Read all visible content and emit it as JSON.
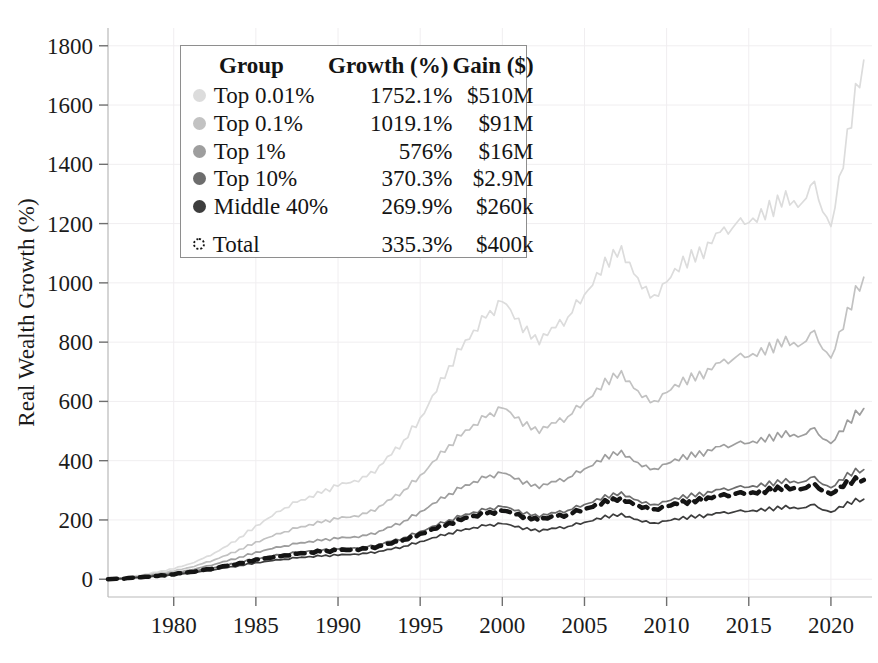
{
  "chart_data": {
    "type": "line",
    "title": "",
    "xlabel": "",
    "ylabel": "Real Wealth Growth (%)",
    "xlim": [
      1976,
      2022.5
    ],
    "ylim": [
      -60,
      1860
    ],
    "grid": true,
    "legend_position": "upper-left-inset",
    "xticks": [
      1980,
      1985,
      1990,
      1995,
      2000,
      2005,
      2010,
      2015,
      2020
    ],
    "yticks": [
      0,
      200,
      400,
      600,
      800,
      1000,
      1200,
      1400,
      1600,
      1800
    ],
    "x": [
      1976,
      1977,
      1978,
      1979,
      1980,
      1981,
      1982,
      1983,
      1984,
      1985,
      1986,
      1987,
      1988,
      1989,
      1990,
      1991,
      1992,
      1993,
      1994,
      1995,
      1996,
      1997,
      1998,
      1999,
      2000,
      2001,
      2002,
      2003,
      2004,
      2005,
      2006,
      2007,
      2008,
      2009,
      2010,
      2011,
      2012,
      2013,
      2014,
      2015,
      2016,
      2017,
      2018,
      2019,
      2020,
      2021,
      2022
    ],
    "series": [
      {
        "name": "Top 0.01%",
        "color": "#dcdcdc",
        "style": "solid",
        "growth_pct": "1752.1%",
        "gain_usd": "$510M",
        "values": [
          0,
          6,
          14,
          24,
          36,
          52,
          74,
          104,
          140,
          178,
          215,
          250,
          272,
          292,
          318,
          330,
          352,
          408,
          468,
          540,
          640,
          742,
          820,
          880,
          940,
          870,
          800,
          840,
          890,
          960,
          1040,
          1120,
          1040,
          940,
          1000,
          1075,
          1090,
          1160,
          1200,
          1210,
          1230,
          1290,
          1260,
          1320,
          1180,
          1500,
          1752
        ]
      },
      {
        "name": "Top 0.1%",
        "color": "#c2c2c2",
        "style": "solid",
        "growth_pct": "1019.1%",
        "gain_usd": "$91M",
        "values": [
          0,
          5,
          11,
          19,
          28,
          40,
          56,
          76,
          100,
          124,
          146,
          166,
          180,
          192,
          206,
          212,
          226,
          262,
          300,
          348,
          408,
          466,
          510,
          545,
          580,
          540,
          498,
          522,
          552,
          598,
          648,
          700,
          650,
          590,
          628,
          672,
          682,
          724,
          750,
          756,
          768,
          806,
          788,
          825,
          740,
          905,
          1019
        ]
      },
      {
        "name": "Top 1%",
        "color": "#9e9e9e",
        "style": "solid",
        "growth_pct": "576%",
        "gain_usd": "$16M",
        "values": [
          0,
          4,
          9,
          15,
          22,
          31,
          43,
          58,
          74,
          90,
          104,
          116,
          125,
          131,
          139,
          142,
          150,
          172,
          196,
          226,
          262,
          296,
          322,
          342,
          360,
          336,
          310,
          326,
          344,
          372,
          402,
          432,
          402,
          366,
          388,
          414,
          420,
          444,
          458,
          462,
          470,
          492,
          482,
          502,
          454,
          530,
          576
        ]
      },
      {
        "name": "Top 10%",
        "color": "#6d6d6d",
        "style": "solid",
        "growth_pct": "370.3%",
        "gain_usd": "$2.9M",
        "values": [
          0,
          3,
          7,
          12,
          18,
          25,
          34,
          45,
          57,
          69,
          79,
          88,
          94,
          98,
          103,
          105,
          110,
          125,
          140,
          160,
          183,
          205,
          222,
          234,
          246,
          230,
          212,
          222,
          234,
          252,
          272,
          292,
          272,
          248,
          262,
          280,
          284,
          300,
          310,
          313,
          318,
          333,
          326,
          340,
          306,
          355,
          370
        ]
      },
      {
        "name": "Middle 40%",
        "color": "#3d3d3d",
        "style": "solid",
        "growth_pct": "269.9%",
        "gain_usd": "$260k",
        "values": [
          0,
          3,
          6,
          10,
          15,
          21,
          28,
          37,
          46,
          55,
          63,
          70,
          75,
          78,
          82,
          84,
          88,
          99,
          111,
          126,
          143,
          159,
          171,
          180,
          188,
          176,
          163,
          170,
          179,
          192,
          206,
          220,
          205,
          187,
          196,
          208,
          211,
          222,
          229,
          231,
          234,
          244,
          239,
          248,
          224,
          258,
          270
        ]
      },
      {
        "name": "Total",
        "color": "#141414",
        "style": "dashed",
        "growth_pct": "335.3%",
        "gain_usd": "$400k",
        "values": [
          0,
          3,
          7,
          11,
          17,
          24,
          32,
          43,
          54,
          65,
          74,
          83,
          89,
          93,
          98,
          100,
          105,
          118,
          133,
          152,
          173,
          194,
          210,
          221,
          232,
          217,
          200,
          209,
          220,
          237,
          255,
          274,
          255,
          232,
          245,
          261,
          265,
          280,
          289,
          291,
          296,
          310,
          303,
          316,
          285,
          331,
          335
        ]
      }
    ]
  },
  "legend": {
    "headers": {
      "group": "Group",
      "growth": "Growth (%)",
      "gain": "Gain ($)"
    },
    "rows": [
      {
        "label": "Top 0.01%",
        "growth": "1752.1%",
        "gain": "$510M"
      },
      {
        "label": "Top 0.1%",
        "growth": "1019.1%",
        "gain": "$91M"
      },
      {
        "label": "Top 1%",
        "growth": "576%",
        "gain": "$16M"
      },
      {
        "label": "Top 10%",
        "growth": "370.3%",
        "gain": "$2.9M"
      },
      {
        "label": "Middle 40%",
        "growth": "269.9%",
        "gain": "$260k"
      },
      {
        "label": "Total",
        "growth": "335.3%",
        "gain": "$400k"
      }
    ]
  },
  "axes": {
    "y_title": "Real Wealth Growth (%)",
    "y_ticks": [
      "0",
      "200",
      "400",
      "600",
      "800",
      "1000",
      "1200",
      "1400",
      "1600",
      "1800"
    ],
    "x_ticks": [
      "1980",
      "1985",
      "1990",
      "1995",
      "2000",
      "2005",
      "2010",
      "2015",
      "2020"
    ]
  }
}
